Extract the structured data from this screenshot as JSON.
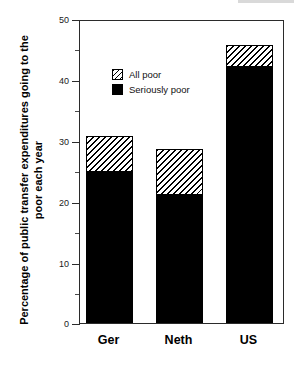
{
  "chart_data": {
    "type": "bar",
    "title": "",
    "subtitle": "",
    "xlabel": "",
    "ylabel": "Percentage of public transfer expenditures going to the poor each year",
    "categories": [
      "Ger",
      "Neth",
      "US"
    ],
    "stacked": true,
    "ylim": [
      0,
      50
    ],
    "yticks": [
      0,
      10,
      20,
      30,
      40,
      50
    ],
    "ytick_labels": [
      "0",
      "10",
      "20",
      "30",
      "40",
      "50"
    ],
    "yminor_ticks": [
      5,
      15,
      25,
      35,
      45
    ],
    "grid": false,
    "legend_position": "upper-left-inside",
    "series": [
      {
        "name": "Seriously poor",
        "fill": "solid-black",
        "color": "#000000",
        "values": [
          25.0,
          21.2,
          42.4
        ]
      },
      {
        "name": "All poor",
        "fill": "diagonal-hatch",
        "color": "#000000",
        "values": [
          31.0,
          28.8,
          46.0
        ]
      }
    ]
  },
  "axes": {
    "y_title_line1": "Percentage of public transfer expenditures",
    "y_title_line2": "going to the poor each year",
    "y_title": "Percentage of public transfer expenditures going to the poor each year",
    "ytick_labels": [
      "50",
      "40",
      "30",
      "20",
      "10",
      "0"
    ],
    "xtick_labels": [
      "Ger",
      "Neth",
      "US"
    ]
  },
  "legend": {
    "items": [
      {
        "label": "All poor",
        "swatch": "hatched-swatch"
      },
      {
        "label": "Seriously poor",
        "swatch": "solid-black-swatch"
      }
    ]
  },
  "colors": {
    "ink": "#000000",
    "frame": "#2b2b2b",
    "background": "#ffffff"
  }
}
